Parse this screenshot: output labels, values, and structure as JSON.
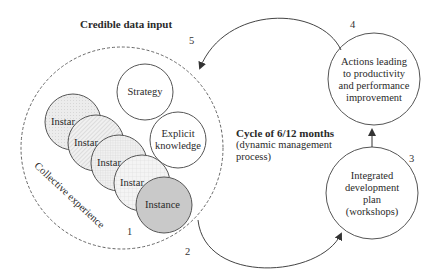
{
  "title": "Credible data input",
  "cycle": {
    "heading": "Cycle of 6/12 months",
    "line2": "(dynamic management",
    "line3": "process)"
  },
  "collective": {
    "label": "Collective experience",
    "strategy": "Strategy",
    "explicit_line1": "Explicit",
    "explicit_line2": "knowledge",
    "instances": [
      {
        "label": "Instar",
        "fill": "#e8e8e8",
        "pattern": "dots-light"
      },
      {
        "label": "Instar",
        "fill": "#ececec",
        "pattern": "diagonal-hatch"
      },
      {
        "label": "Instar",
        "fill": "#eeeeee",
        "pattern": "grid-fine"
      },
      {
        "label": "Instar",
        "fill": "#f2f2f2",
        "pattern": "crosshatch"
      },
      {
        "label": "Instance",
        "fill": "#c8c8c8",
        "pattern": "solid"
      }
    ]
  },
  "nodes": {
    "actions": [
      "Actions leading",
      "to productivity",
      "and performance",
      "improvement"
    ],
    "integrated": [
      "Integrated",
      "development",
      "plan",
      "(workshops)"
    ]
  },
  "step_numbers": {
    "one": "1",
    "two": "2",
    "three": "3",
    "four": "4",
    "five": "5"
  },
  "colors": {
    "stroke": "#555555",
    "dashed": "#666666",
    "instance_dark": "#c8c8c8"
  }
}
